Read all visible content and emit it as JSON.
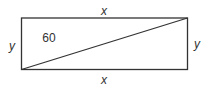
{
  "diagram": {
    "type": "rectangle-with-diagonal",
    "labels": {
      "top": "x",
      "bottom": "x",
      "left": "y",
      "right": "y",
      "area_label": "60"
    },
    "colors": {
      "stroke": "#333333",
      "background": "#ffffff"
    }
  }
}
